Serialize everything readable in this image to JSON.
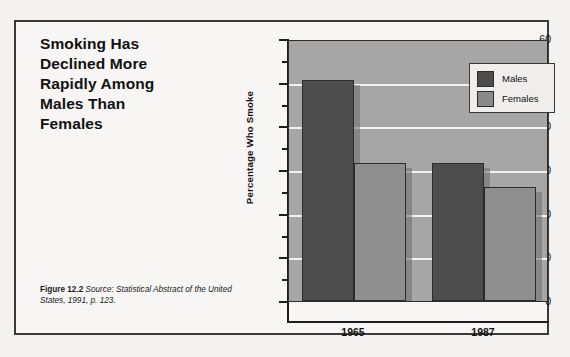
{
  "figure": {
    "title_lines": [
      "Smoking Has",
      "Declined More",
      "Rapidly Among",
      "Males Than",
      "Females"
    ],
    "caption_label": "Figure 12.2",
    "caption_text": "Source: Statistical Abstract of the United States, 1991, p. 123."
  },
  "colors": {
    "males": "#4d4d4d",
    "females": "#8f8f8f",
    "plot_background": "#a6a6a6",
    "gridline": "#f2f2f2",
    "axis": "#1e1e1e",
    "frame": "#3a3a3a",
    "page_background": "#f3f2f0"
  },
  "chart_data": {
    "type": "bar",
    "title": "Smoking Has Declined More Rapidly Among Males Than Females",
    "xlabel": "",
    "ylabel": "Percentage Who Smoke",
    "categories": [
      "1965",
      "1987"
    ],
    "series": [
      {
        "name": "Males",
        "values": [
          50.5,
          31.5
        ]
      },
      {
        "name": "Females",
        "values": [
          31.5,
          26.0
        ]
      }
    ],
    "ylim": [
      0,
      60
    ],
    "yticks": [
      0,
      10,
      20,
      30,
      40,
      50,
      60
    ],
    "ytick_labels": [
      "0",
      "10",
      "20",
      "30",
      "40",
      "50",
      "60"
    ],
    "yminor_ticks": [
      5,
      15,
      25,
      35,
      45,
      55
    ],
    "grid": true,
    "grid_axis": "y",
    "legend": [
      "Males",
      "Females"
    ],
    "legend_position": "upper right"
  }
}
